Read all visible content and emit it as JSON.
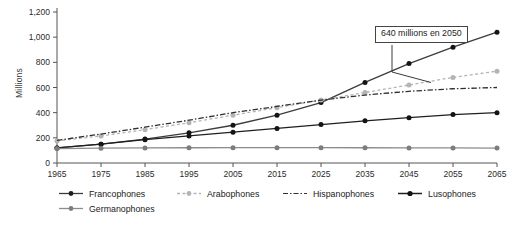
{
  "chart_data": {
    "type": "line",
    "title": "",
    "xlabel": "",
    "ylabel": "Millions",
    "xlim": [
      1965,
      2065
    ],
    "ylim": [
      0,
      1200
    ],
    "grid": false,
    "legend_position": "bottom",
    "annotations": [
      {
        "text": "640 millions en 2050",
        "target_x": 2050,
        "target_y": 640,
        "series": "Francophones"
      }
    ],
    "x": [
      1965,
      1975,
      1985,
      1995,
      2005,
      2015,
      2025,
      2035,
      2045,
      2055,
      2065
    ],
    "xtick_labels": [
      "1965",
      "1975",
      "1985",
      "1995",
      "2005",
      "2015",
      "2025",
      "2035",
      "2045",
      "2055",
      "2065"
    ],
    "ytick_labels": [
      "0",
      "200",
      "400",
      "600",
      "800",
      "1,000",
      "1,200"
    ],
    "ytick_values": [
      0,
      200,
      400,
      600,
      800,
      1000,
      1200
    ],
    "series": [
      {
        "name": "Francophones",
        "color": "#3c3c3c",
        "style": "solid",
        "marker": "circle",
        "values": [
          120,
          150,
          190,
          240,
          300,
          380,
          480,
          640,
          790,
          920,
          1040
        ]
      },
      {
        "name": "Arabophones",
        "color": "#b4b4b4",
        "style": "dotted",
        "marker": "circle",
        "values": [
          175,
          215,
          265,
          320,
          380,
          440,
          500,
          560,
          620,
          680,
          730
        ]
      },
      {
        "name": "Hispanophones",
        "color": "#2f2f2f",
        "style": "dashdot",
        "marker": "none",
        "values": [
          180,
          230,
          285,
          340,
          400,
          450,
          500,
          540,
          570,
          590,
          600
        ]
      },
      {
        "name": "Lusophones",
        "color": "#1f1f1f",
        "style": "solid",
        "marker": "circle",
        "values": [
          120,
          150,
          185,
          215,
          245,
          275,
          305,
          335,
          360,
          385,
          400
        ]
      },
      {
        "name": "Germanophones",
        "color": "#8c8c8c",
        "style": "solid",
        "marker": "circle",
        "values": [
          115,
          118,
          120,
          121,
          122,
          122,
          122,
          121,
          120,
          120,
          119
        ]
      }
    ]
  },
  "legend": {
    "items": [
      {
        "label": "Francophones"
      },
      {
        "label": "Arabophones"
      },
      {
        "label": "Hispanophones"
      },
      {
        "label": "Lusophones"
      },
      {
        "label": "Germanophones"
      }
    ]
  }
}
